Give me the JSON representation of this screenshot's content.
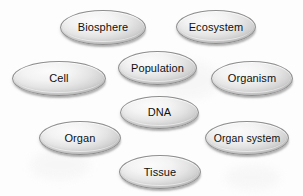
{
  "diagram": {
    "type": "labelled-ellipse-cluster",
    "background_color": "#fdfdfd",
    "node_fill_light": "#fbfbfb",
    "node_fill_dark": "#c6c6c6",
    "node_border_color": "#8e8e8e",
    "text_color": "#101010",
    "nodes": [
      {
        "id": "biosphere",
        "label": "Biosphere",
        "x": 60,
        "y": 10,
        "w": 86,
        "h": 35
      },
      {
        "id": "ecosystem",
        "label": "Ecosystem",
        "x": 176,
        "y": 10,
        "w": 80,
        "h": 34
      },
      {
        "id": "cell",
        "label": "Cell",
        "x": 12,
        "y": 61,
        "w": 94,
        "h": 35
      },
      {
        "id": "population",
        "label": "Population",
        "x": 118,
        "y": 51,
        "w": 79,
        "h": 34
      },
      {
        "id": "organism",
        "label": "Organism",
        "x": 211,
        "y": 61,
        "w": 82,
        "h": 35
      },
      {
        "id": "dna",
        "label": "DNA",
        "x": 120,
        "y": 96,
        "w": 79,
        "h": 33
      },
      {
        "id": "organ",
        "label": "Organ",
        "x": 39,
        "y": 121,
        "w": 82,
        "h": 34
      },
      {
        "id": "organ-system",
        "label": "Organ system",
        "x": 205,
        "y": 121,
        "w": 84,
        "h": 34
      },
      {
        "id": "tissue",
        "label": "Tissue",
        "x": 119,
        "y": 155,
        "w": 82,
        "h": 34
      }
    ]
  }
}
